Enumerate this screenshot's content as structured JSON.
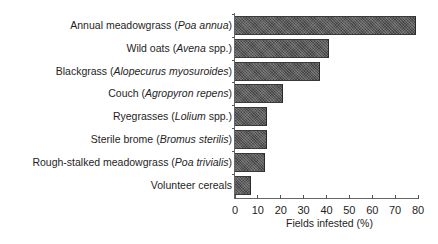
{
  "chart_data": {
    "type": "bar",
    "orientation": "horizontal",
    "title": "",
    "xlabel": "Fields infested (%)",
    "ylabel": "",
    "xlim": [
      0,
      80
    ],
    "xticks": [
      0,
      10,
      20,
      30,
      40,
      50,
      60,
      70,
      80
    ],
    "grid": false,
    "legend": null,
    "categories": [
      {
        "common": "Annual meadowgrass",
        "latin": "Poa annua",
        "suffix": ""
      },
      {
        "common": "Wild oats",
        "latin": "Avena",
        "suffix": " spp."
      },
      {
        "common": "Blackgrass",
        "latin": "Alopecurus myosuroides",
        "suffix": ""
      },
      {
        "common": "Couch",
        "latin": "Agropyron repens",
        "suffix": ""
      },
      {
        "common": "Ryegrasses",
        "latin": "Lolium",
        "suffix": " spp."
      },
      {
        "common": "Sterile brome",
        "latin": "Bromus sterilis",
        "suffix": ""
      },
      {
        "common": "Rough-stalked meadowgrass",
        "latin": "Poa trivialis",
        "suffix": ""
      },
      {
        "common": "Volunteer cereals",
        "latin": "",
        "suffix": ""
      }
    ],
    "category_labels": [
      "Annual meadowgrass (Poa annua)",
      "Wild oats (Avena spp.)",
      "Blackgrass (Alopecurus myosuroides)",
      "Couch (Agropyron repens)",
      "Ryegrasses (Lolium spp.)",
      "Sterile brome (Bromus sterilis)",
      "Rough-stalked meadowgrass (Poa trivialis)",
      "Volunteer cereals"
    ],
    "values": [
      79,
      41,
      37,
      21,
      14,
      14,
      13,
      7
    ],
    "bar_color": "#5a5a5a"
  }
}
